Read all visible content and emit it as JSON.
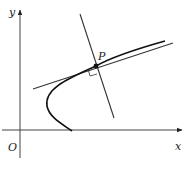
{
  "diagram": {
    "labels": {
      "y_axis": "y",
      "x_axis": "x",
      "origin": "O",
      "point": "P"
    },
    "elements": [
      {
        "name": "x-axis",
        "type": "axis"
      },
      {
        "name": "y-axis",
        "type": "axis"
      },
      {
        "name": "curve",
        "type": "curve",
        "shape": "parabola opening right"
      },
      {
        "name": "tangent-line",
        "type": "line",
        "relation": "tangent to curve at P"
      },
      {
        "name": "normal-line",
        "type": "line",
        "relation": "perpendicular to tangent at P"
      },
      {
        "name": "point-p",
        "type": "point"
      },
      {
        "name": "right-angle-marker",
        "type": "marker"
      }
    ],
    "colors": {
      "ink": "#222222",
      "background": "#ffffff"
    }
  }
}
